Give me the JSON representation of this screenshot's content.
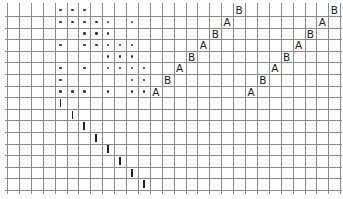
{
  "grid": {
    "origin_x": 7,
    "origin_y": 4.4,
    "cell_w": 11.9,
    "cell_h": 11.6,
    "cols": 28,
    "rows": 16,
    "line_color": "#8a8a8a",
    "mark_color": "#1a1a1a"
  },
  "dots": [
    [
      0,
      4
    ],
    [
      0,
      5
    ],
    [
      0,
      6
    ],
    [
      1,
      4
    ],
    [
      1,
      5
    ],
    [
      1,
      6
    ],
    [
      1,
      7
    ],
    [
      1,
      8
    ],
    [
      1,
      10
    ],
    [
      2,
      6
    ],
    [
      2,
      7
    ],
    [
      2,
      8
    ],
    [
      3,
      4
    ],
    [
      3,
      6
    ],
    [
      3,
      7
    ],
    [
      3,
      8
    ],
    [
      3,
      9
    ],
    [
      3,
      10
    ],
    [
      4,
      8
    ],
    [
      4,
      9
    ],
    [
      4,
      10
    ],
    [
      5,
      4
    ],
    [
      5,
      6
    ],
    [
      5,
      8
    ],
    [
      5,
      9
    ],
    [
      5,
      10
    ],
    [
      5,
      11
    ],
    [
      6,
      4
    ],
    [
      6,
      10
    ],
    [
      6,
      11
    ],
    [
      7,
      4
    ],
    [
      7,
      5
    ],
    [
      7,
      6
    ],
    [
      7,
      8
    ],
    [
      7,
      10
    ],
    [
      7,
      11
    ]
  ],
  "letters": [
    {
      "row": 7,
      "col": 12,
      "text": "A"
    },
    {
      "row": 6,
      "col": 13,
      "text": "B"
    },
    {
      "row": 5,
      "col": 14,
      "text": "A"
    },
    {
      "row": 4,
      "col": 15,
      "text": "B"
    },
    {
      "row": 3,
      "col": 16,
      "text": "A"
    },
    {
      "row": 2,
      "col": 17,
      "text": "B"
    },
    {
      "row": 1,
      "col": 18,
      "text": "A"
    },
    {
      "row": 0,
      "col": 19,
      "text": "B"
    },
    {
      "row": 7,
      "col": 20,
      "text": "A"
    },
    {
      "row": 6,
      "col": 21,
      "text": "B"
    },
    {
      "row": 5,
      "col": 22,
      "text": "A"
    },
    {
      "row": 4,
      "col": 23,
      "text": "B"
    },
    {
      "row": 3,
      "col": 24,
      "text": "A"
    },
    {
      "row": 2,
      "col": 25,
      "text": "B"
    },
    {
      "row": 1,
      "col": 26,
      "text": "A"
    },
    {
      "row": 0,
      "col": 27,
      "text": "B"
    }
  ],
  "bars": [
    {
      "row": 8,
      "col": 4,
      "text": "I"
    },
    {
      "row": 9,
      "col": 5,
      "text": "I"
    },
    {
      "row": 10,
      "col": 6,
      "text": "I"
    },
    {
      "row": 11,
      "col": 7,
      "text": "I"
    },
    {
      "row": 12,
      "col": 8,
      "text": "I"
    },
    {
      "row": 13,
      "col": 9,
      "text": "I"
    },
    {
      "row": 14,
      "col": 10,
      "text": "I"
    },
    {
      "row": 15,
      "col": 11,
      "text": "I"
    }
  ]
}
